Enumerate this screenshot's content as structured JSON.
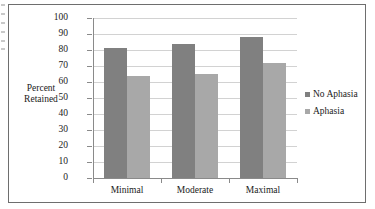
{
  "chart_data": {
    "type": "bar",
    "title": "",
    "xlabel": "",
    "ylabel": "Percent Retained",
    "categories": [
      "Minimal",
      "Moderate",
      "Maximal"
    ],
    "series": [
      {
        "name": "No Aphasia",
        "color": "#808080",
        "values": [
          81,
          84,
          88
        ]
      },
      {
        "name": "Aphasia",
        "color": "#a8a8a8",
        "values": [
          64,
          65,
          72
        ]
      }
    ],
    "ylim": [
      0,
      100
    ],
    "yticks": [
      0,
      10,
      20,
      30,
      40,
      50,
      60,
      70,
      80,
      90,
      100
    ],
    "ytick_labels": [
      "0",
      "10",
      "20",
      "30",
      "40",
      "50",
      "60",
      "70",
      "80",
      "90",
      "100"
    ],
    "grid": "horizontal",
    "legend_position": "right",
    "legend_entries": [
      "No Aphasia",
      "Aphasia"
    ]
  }
}
